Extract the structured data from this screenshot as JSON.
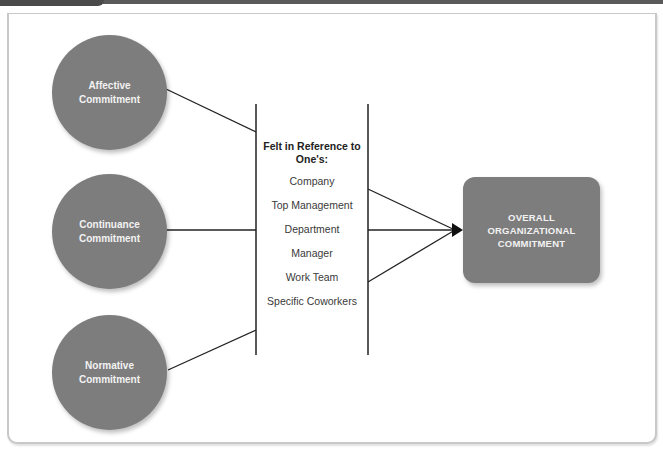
{
  "header": {
    "bar_color": "#5a5a5a",
    "tab_color": "#4a4a4a"
  },
  "colors": {
    "node_fill": "#7d7d7d",
    "node_text": "#f2f2f2",
    "line": "#222222",
    "frame_border": "#c8c8c8"
  },
  "inputs": [
    {
      "id": "affective",
      "label": "Affective Commitment"
    },
    {
      "id": "continuance",
      "label": "Continuance Commitment"
    },
    {
      "id": "normative",
      "label": "Normative Commitment"
    }
  ],
  "referents": {
    "heading": "Felt in Reference to One's:",
    "items": [
      "Company",
      "Top Management",
      "Department",
      "Manager",
      "Work Team",
      "Specific Coworkers"
    ]
  },
  "outcome": {
    "label": "OVERALL ORGANIZATIONAL COMMITMENT"
  }
}
